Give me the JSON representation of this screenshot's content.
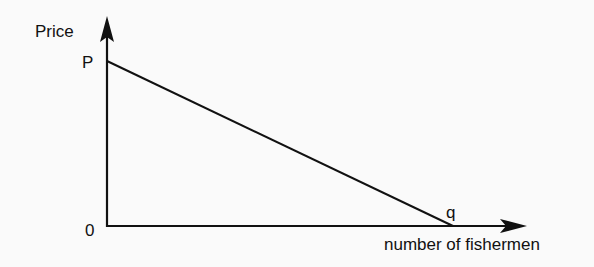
{
  "diagram": {
    "type": "line",
    "y_axis_label": "Price",
    "x_axis_label": "number of fishermen",
    "origin_label": "0",
    "y_intercept_label": "P",
    "x_intercept_label": "q",
    "line": {
      "description": "Downward-sloping straight line from P on the price axis to q on the fishermen axis",
      "start": {
        "x": 0,
        "y": "P"
      },
      "end": {
        "x": "q",
        "y": 0
      }
    },
    "colors": {
      "ink": "#111111",
      "background": "#fafafa"
    }
  }
}
